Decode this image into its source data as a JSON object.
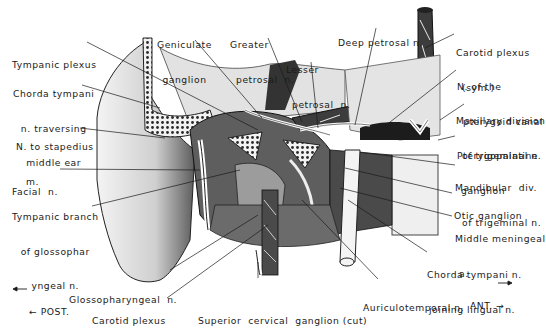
{
  "diagram": {
    "type": "anatomical-illustration",
    "orientation": {
      "posterior": "← POST.",
      "anterior": "ANT. →"
    },
    "labels": {
      "tympanic_plexus": [
        "Tympanic plexus"
      ],
      "chorda_tympani_middle_ear": [
        "Chorda tympani",
        "n. traversing",
        "middle ear"
      ],
      "n_to_stapedius": [
        "N. to stapedius",
        "m."
      ],
      "facial_n": [
        "Facial  n."
      ],
      "tympanic_branch_glossopharyngeal": [
        "Tympanic branch",
        "of glossophar",
        "yngeal n."
      ],
      "glossopharyngeal_n": [
        "Glossopharyngeal  n."
      ],
      "carotid_plexus": [
        "Carotid plexus"
      ],
      "superior_cervical_ganglion": [
        "Superior  cervical  ganglion (cut)"
      ],
      "geniculate_ganglion": [
        "Geniculate",
        "ganglion"
      ],
      "greater_petrosal_n": [
        "Greater",
        "petrosal  n."
      ],
      "lesser_petrosal_n": [
        "Lesser",
        "petrosal  n."
      ],
      "deep_petrosal_n": [
        "Deep petrosal n."
      ],
      "carotid_plexus_sym": [
        "Carotid plexus",
        "(sym.)"
      ],
      "n_pterygoid_canal": [
        "N. of the",
        "pterygoid canal"
      ],
      "maxillary_division": [
        "Maxillary division",
        "of trigeminal n."
      ],
      "pterygopalatine_ganglion": [
        "Pterygopalatine",
        "ganglion"
      ],
      "mandibular_div": [
        "Mandibular  div.",
        "of trigeminal n."
      ],
      "otic_ganglion": [
        "Otic ganglion"
      ],
      "middle_meningeal_a": [
        "Middle meningeal",
        "a."
      ],
      "chorda_tympani_lingual": [
        "Chorda tympani n.",
        "joining lingual n."
      ],
      "auriculotemporal_n": [
        "Auriculotemporal n."
      ]
    },
    "colors": {
      "ink": "#1a1a1a",
      "paper": "#ffffff",
      "shade_dark": "#3a3a3a",
      "shade_mid": "#8a8a8a",
      "shade_light": "#d8d8d8"
    }
  }
}
